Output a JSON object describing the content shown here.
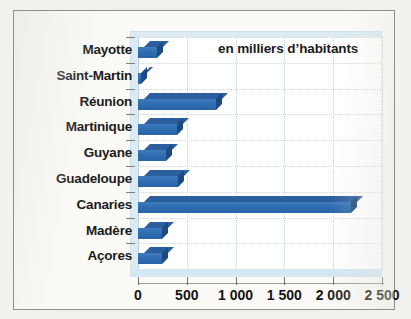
{
  "annotation": "en milliers d’habitants",
  "chart_data": {
    "type": "bar",
    "orientation": "horizontal",
    "title": "",
    "subtitle": "",
    "annotations": [
      "en milliers d’habitants"
    ],
    "xlabel": "",
    "ylabel": "",
    "xlim": [
      0,
      2500
    ],
    "grid": true,
    "legend": null,
    "series_color": "#2f6cb0",
    "categories": [
      "Mayotte",
      "Saint-Martin",
      "Réunion",
      "Martinique",
      "Guyane",
      "Guadeloupe",
      "Canaries",
      "Madère",
      "Açores"
    ],
    "values": [
      190,
      35,
      800,
      400,
      290,
      405,
      2180,
      250,
      245
    ],
    "xticks": [
      0,
      500,
      1000,
      1500,
      2000,
      2500
    ],
    "xtick_labels": [
      "0",
      "500",
      "1 000",
      "1 500",
      "2 000",
      "2 500"
    ]
  }
}
